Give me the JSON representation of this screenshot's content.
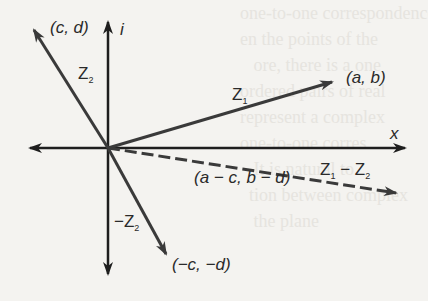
{
  "diagram": {
    "axes": {
      "x_label": "x",
      "y_label": "i"
    },
    "vectors": [
      {
        "name": "Z1",
        "label_main": "Z",
        "label_sub": "1",
        "end_label": "(a, b)",
        "style": "solid"
      },
      {
        "name": "Z2",
        "label_main": "Z",
        "label_sub": "2",
        "end_label": "(c, d)",
        "style": "solid"
      },
      {
        "name": "-Z2",
        "label_main": "−Z",
        "label_sub": "2",
        "end_label": "(−c, −d)",
        "style": "solid"
      },
      {
        "name": "Z1-Z2",
        "label_main_1": "Z",
        "label_sub_1": "1",
        "label_minus": "−",
        "label_main_2": "Z",
        "label_sub_2": "2",
        "end_label": "(a − c, b − d)",
        "style": "dashed"
      }
    ],
    "colors": {
      "axis": "#1e1e1e",
      "vector": "#3a3a3a",
      "background": "#f4f3f0"
    }
  }
}
